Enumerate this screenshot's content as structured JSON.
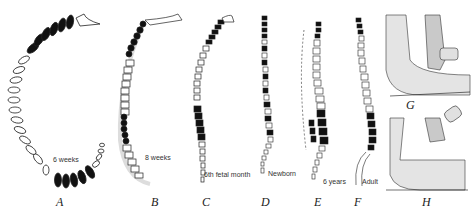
{
  "figure": {
    "panels": [
      {
        "letter": "A",
        "age": "6 weeks"
      },
      {
        "letter": "B",
        "age": "8 weeks"
      },
      {
        "letter": "C",
        "age": "6th fetal month"
      },
      {
        "letter": "D",
        "age": "Newborn"
      },
      {
        "letter": "E",
        "age": "6 years"
      },
      {
        "letter": "F",
        "age": "Adult"
      },
      {
        "letter": "G",
        "age": ""
      },
      {
        "letter": "H",
        "age": ""
      }
    ],
    "colors": {
      "ink": "#111111",
      "paper": "#ffffff",
      "shade": "#cfcfcf"
    }
  }
}
